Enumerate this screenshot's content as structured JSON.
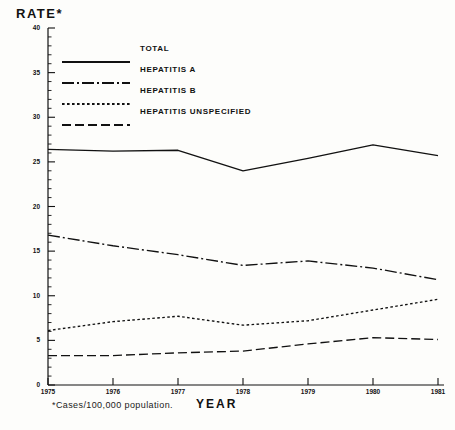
{
  "chart_data": {
    "type": "line",
    "title": "",
    "ylabel": "RATE*",
    "xlabel": "YEAR",
    "footnote": "*Cases/100,000 population.",
    "x": [
      1975,
      1976,
      1977,
      1978,
      1979,
      1980,
      1981
    ],
    "categories": [
      "1975",
      "1976",
      "1977",
      "1978",
      "1979",
      "1980",
      "1981"
    ],
    "ylim": [
      0,
      40
    ],
    "yticks": [
      0,
      5,
      10,
      15,
      20,
      25,
      30,
      35,
      40
    ],
    "ytick_labels": [
      "0",
      "5",
      "10",
      "15",
      "20",
      "25",
      "30",
      "35",
      "40"
    ],
    "grid": false,
    "legend_position": "upper-left-inside",
    "series": [
      {
        "name": "TOTAL",
        "style": "solid",
        "color": "#111111",
        "values": [
          26.4,
          26.2,
          26.3,
          24.0,
          25.4,
          26.9,
          25.7
        ]
      },
      {
        "name": "HEPATITIS A",
        "style": "dash-dot",
        "color": "#111111",
        "values": [
          16.8,
          15.6,
          14.6,
          13.4,
          13.9,
          13.1,
          11.8
        ]
      },
      {
        "name": "HEPATITIS B",
        "style": "dotted",
        "color": "#111111",
        "values": [
          6.1,
          7.1,
          7.7,
          6.7,
          7.2,
          8.4,
          9.6
        ]
      },
      {
        "name": "HEPATITIS UNSPECIFIED",
        "style": "dashed",
        "color": "#111111",
        "values": [
          3.3,
          3.3,
          3.6,
          3.8,
          4.6,
          5.3,
          5.1
        ]
      }
    ]
  },
  "legend": {
    "items": [
      {
        "label": "TOTAL",
        "style": "solid"
      },
      {
        "label": "HEPATITIS A",
        "style": "dash-dot"
      },
      {
        "label": "HEPATITIS B",
        "style": "dotted"
      },
      {
        "label": "HEPATITIS UNSPECIFIED",
        "style": "dashed"
      }
    ]
  },
  "axes": {
    "y_title": "RATE*",
    "x_title": "YEAR"
  },
  "footnote": "*Cases/100,000 population."
}
